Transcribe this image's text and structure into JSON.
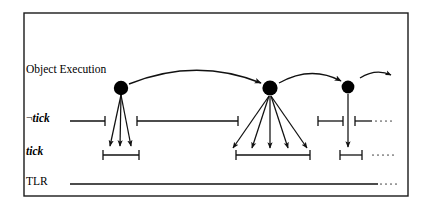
{
  "figure": {
    "frame": {
      "x": 24,
      "y": 13,
      "width": 384,
      "height": 183,
      "stroke": "#1a1a1a",
      "stroke_width": 1.4,
      "fill": "#ffffff"
    },
    "colors": {
      "ink": "#111111",
      "node_fill": "#000000",
      "background": "#ffffff",
      "dots": "#555555"
    }
  },
  "labels": {
    "object_execution": "Object Execution",
    "not_tick_negation": "¬",
    "not_tick_word": "tick",
    "tick": "tick",
    "tlr": "TLR"
  },
  "rows": {
    "object_execution_y": 88,
    "not_tick_y": 121,
    "tick_y": 155,
    "tlr_y": 184
  },
  "nodes": [
    {
      "name": "node-1",
      "cx": 121,
      "cy": 88,
      "r": 7.2,
      "fan_out": 3
    },
    {
      "name": "node-2",
      "cx": 270,
      "cy": 88,
      "r": 7.6,
      "fan_out": 5
    },
    {
      "name": "node-3",
      "cx": 348,
      "cy": 87,
      "r": 6.4,
      "fan_out": 1
    }
  ],
  "execution_arcs": [
    {
      "name": "arc-node1-to-node2",
      "x1": 130,
      "y1": 84,
      "x2": 262,
      "y2": 84,
      "lift": 20
    },
    {
      "name": "arc-node2-to-node3",
      "x1": 279,
      "y1": 83,
      "x2": 341,
      "y2": 82,
      "lift": 13
    },
    {
      "name": "arc-node3-trailing",
      "x1": 359,
      "y1": 78,
      "x2": 391,
      "y2": 76,
      "lift": 8
    }
  ],
  "fan_arrows": {
    "node1": [
      {
        "x1": 121,
        "y1": 95,
        "x2": 110,
        "y2": 148
      },
      {
        "x1": 121,
        "y1": 95,
        "x2": 120,
        "y2": 148
      },
      {
        "x1": 121,
        "y1": 95,
        "x2": 131,
        "y2": 148
      }
    ],
    "node2": [
      {
        "x1": 270,
        "y1": 96,
        "x2": 232,
        "y2": 150
      },
      {
        "x1": 270,
        "y1": 96,
        "x2": 252,
        "y2": 150
      },
      {
        "x1": 270,
        "y1": 96,
        "x2": 270,
        "y2": 150
      },
      {
        "x1": 270,
        "y1": 96,
        "x2": 288,
        "y2": 150
      },
      {
        "x1": 270,
        "y1": 96,
        "x2": 308,
        "y2": 150
      }
    ],
    "node3": [
      {
        "x1": 348,
        "y1": 94,
        "x2": 348,
        "y2": 149
      }
    ]
  },
  "not_tick_intervals": [
    {
      "name": "not-tick-interval-1",
      "x1": 70,
      "x2": 105,
      "y": 121,
      "cap_left": false,
      "cap_right": true
    },
    {
      "name": "not-tick-interval-2",
      "x1": 137,
      "x2": 238,
      "y": 121,
      "cap_left": true,
      "cap_right": true
    },
    {
      "name": "not-tick-interval-3",
      "x1": 318,
      "x2": 343,
      "y": 121,
      "cap_left": true,
      "cap_right": true
    },
    {
      "name": "not-tick-interval-4",
      "x1": 355,
      "x2": 372,
      "y": 121,
      "cap_left": true,
      "cap_right": false
    }
  ],
  "tick_intervals": [
    {
      "name": "tick-interval-1",
      "x1": 103,
      "x2": 139,
      "y": 155
    },
    {
      "name": "tick-interval-2",
      "x1": 236,
      "x2": 310,
      "y": 155
    },
    {
      "name": "tick-interval-3",
      "x1": 340,
      "x2": 362,
      "y": 155
    }
  ],
  "tlr_line": {
    "name": "tlr-line",
    "x1": 70,
    "x2": 378,
    "y": 184
  },
  "ellipses": [
    {
      "name": "ellipsis-not-tick",
      "x": 374,
      "y": 121,
      "text": "····"
    },
    {
      "name": "ellipsis-tick",
      "x": 368,
      "y": 155,
      "text": "·····"
    },
    {
      "name": "ellipsis-tlr",
      "x": 379,
      "y": 184,
      "text": "····"
    }
  ],
  "geometry": {
    "cap_half_height": 5,
    "interval_stroke_width": 1.3,
    "arrow_stroke_width": 1.25,
    "arc_stroke_width": 1.3,
    "tlr_stroke_width": 1.6
  }
}
